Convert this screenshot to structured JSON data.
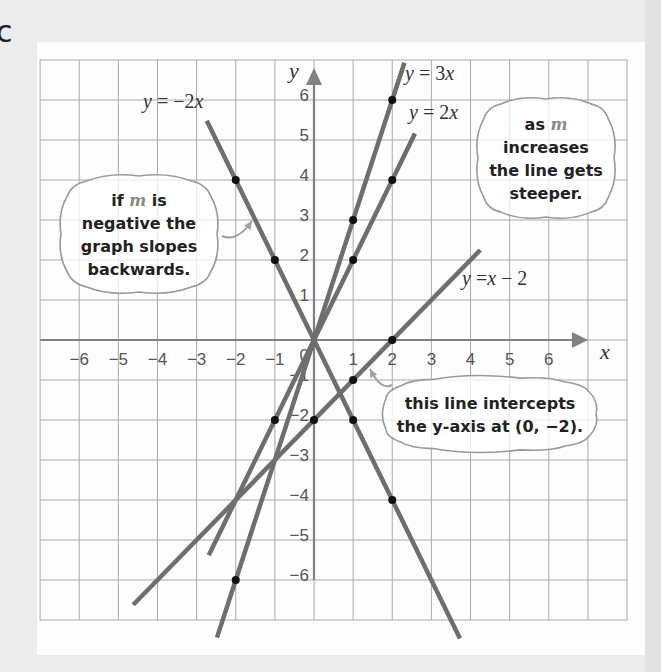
{
  "page": {
    "partial_label": "c",
    "background": "#ececec",
    "card_background": "#fdfdfd"
  },
  "chart_data": {
    "type": "line",
    "title": "",
    "xlabel": "x",
    "ylabel": "y",
    "xlim": [
      -7,
      8
    ],
    "ylim": [
      -7,
      7
    ],
    "grid": true,
    "x_ticks": [
      -6,
      -5,
      -4,
      -3,
      -2,
      -1,
      1,
      2,
      3,
      4,
      5,
      6
    ],
    "y_ticks": [
      -6,
      -5,
      -4,
      -3,
      -2,
      -1,
      1,
      2,
      3,
      4,
      5,
      6
    ],
    "origin_label": "0",
    "x_axis_range": [
      -7,
      7
    ],
    "y_axis_range": [
      -6,
      6.8
    ],
    "series": [
      {
        "name": "y = -2x",
        "label_parts": [
          "y",
          " = −2",
          "x"
        ],
        "slope": -2,
        "intercept": 0,
        "x_range": [
          -2.74,
          3.73
        ],
        "points": [
          [
            -2,
            4
          ],
          [
            -1,
            2
          ],
          [
            1,
            -2
          ],
          [
            2,
            -4
          ]
        ],
        "label_pos": [
          143,
          108
        ]
      },
      {
        "name": "y = 3x",
        "label_parts": [
          "y",
          " = 3",
          "x"
        ],
        "slope": 3,
        "intercept": 0,
        "x_range": [
          -2.48,
          2.31
        ],
        "points": [
          [
            -2,
            -6
          ],
          [
            1,
            3
          ],
          [
            2,
            6
          ]
        ],
        "label_pos": [
          405,
          80
        ]
      },
      {
        "name": "y = 2x",
        "label_parts": [
          "y",
          " = 2",
          "x"
        ],
        "slope": 2,
        "intercept": 0,
        "x_range": [
          -2.69,
          2.58
        ],
        "points": [
          [
            -1,
            -2
          ],
          [
            1,
            2
          ],
          [
            2,
            4
          ]
        ],
        "label_pos": [
          409,
          119
        ]
      },
      {
        "name": "y = x - 2",
        "label_parts": [
          "y",
          " =",
          "x",
          " − 2"
        ],
        "slope": 1,
        "intercept": -2,
        "x_range": [
          -4.62,
          4.25
        ],
        "points": [
          [
            0,
            -2
          ],
          [
            1,
            -1
          ],
          [
            2,
            0
          ]
        ],
        "label_pos": [
          462,
          285
        ]
      }
    ],
    "annotations": [
      {
        "id": "negative-slope-note",
        "lines": [
          [
            "if ",
            {
              "m": "m"
            },
            " is"
          ],
          [
            "negative the"
          ],
          [
            "graph slopes"
          ],
          [
            "backwards."
          ]
        ],
        "text": "if m is negative the graph slopes backwards.",
        "box": [
          55,
          170,
          168,
          128
        ],
        "arrow": [
          [
            222,
            236
          ],
          [
            252,
            221
          ]
        ]
      },
      {
        "id": "steeper-note",
        "lines": [
          [
            "as ",
            {
              "m": "m"
            }
          ],
          [
            "increases"
          ],
          [
            "the line gets"
          ],
          [
            "steeper."
          ]
        ],
        "text": "as m increases the line gets steeper.",
        "box": [
          472,
          93,
          148,
          130
        ],
        "arrow": null
      },
      {
        "id": "intercept-note",
        "lines": [
          [
            "this line intercepts"
          ],
          [
            "the y-axis at (0, −2)."
          ]
        ],
        "text": "this line intercepts the y-axis at (0, −2).",
        "box": [
          378,
          372,
          224,
          84
        ],
        "arrow": [
          [
            392,
            385
          ],
          [
            370,
            369
          ]
        ]
      }
    ],
    "colors": {
      "line": "#6e6e6e",
      "axis": "#808080",
      "grid": "#a9a9a9",
      "dot": "#111111",
      "m_highlight": "#8a8a8a"
    }
  },
  "layout": {
    "origin_px": [
      314,
      340
    ],
    "unit_x_px": 39.13,
    "unit_y_px": 40.0,
    "grid_box_px": [
      40,
      60,
      627,
      620
    ]
  }
}
